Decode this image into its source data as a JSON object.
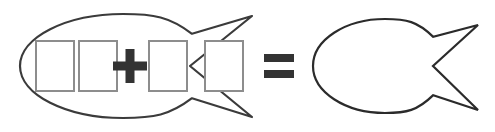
{
  "figure": {
    "title": "fish-equation",
    "background_color": "#ffffff"
  },
  "colors": {
    "fish_stroke": "#3b3b3b",
    "fish_stroke_right": "#2b2b2b",
    "box_stroke": "#8d8d8d",
    "box_fill": "#ffffff",
    "operator": "#333333"
  },
  "equation": {
    "left_term": {
      "name": "fish-with-boxes",
      "icon": "fish-icon",
      "boxes": [
        {
          "label": "",
          "icon": "missing-glyph-box-icon"
        },
        {
          "label": "",
          "icon": "missing-glyph-box-icon"
        },
        {
          "label": "",
          "icon": "missing-glyph-box-icon"
        },
        {
          "label": "",
          "icon": "missing-glyph-box-icon"
        }
      ],
      "box_count": 4,
      "inline_operator": {
        "symbol": "+",
        "name": "plus-icon",
        "after_box_index": 2
      }
    },
    "operator": {
      "symbol": "=",
      "name": "equals-icon"
    },
    "right_term": {
      "name": "fish-plain",
      "icon": "fish-icon",
      "boxes": [],
      "box_count": 0
    }
  },
  "geometry": {
    "left_fish": {
      "body_cx": 123,
      "body_cy": 66,
      "body_rx": 103,
      "body_ry": 52,
      "tail_tip_top_x": 252,
      "tail_tip_top_y": 16,
      "tail_tip_bottom_x": 252,
      "tail_tip_bottom_y": 117,
      "notch_x": 190,
      "notch_y": 66
    },
    "right_fish": {
      "body_cx": 385,
      "body_cy": 66,
      "body_rx": 72,
      "body_ry": 47,
      "tail_tip_top_x": 478,
      "tail_tip_top_y": 25,
      "tail_tip_bottom_x": 478,
      "tail_tip_bottom_y": 110,
      "notch_x": 433,
      "notch_y": 66
    },
    "boxes": [
      {
        "x": 36,
        "y": 41,
        "width": 38,
        "height": 50
      },
      {
        "x": 79,
        "y": 41,
        "width": 38,
        "height": 50
      },
      {
        "x": 149,
        "y": 41,
        "width": 38,
        "height": 50
      },
      {
        "x": 205,
        "y": 41,
        "width": 38,
        "height": 50
      }
    ],
    "plus": {
      "cx": 130,
      "cy": 66,
      "arm": 17,
      "thick": 9
    },
    "equals": {
      "cx": 279,
      "cy": 66,
      "width": 30,
      "bar_height": 8,
      "gap": 8
    }
  }
}
